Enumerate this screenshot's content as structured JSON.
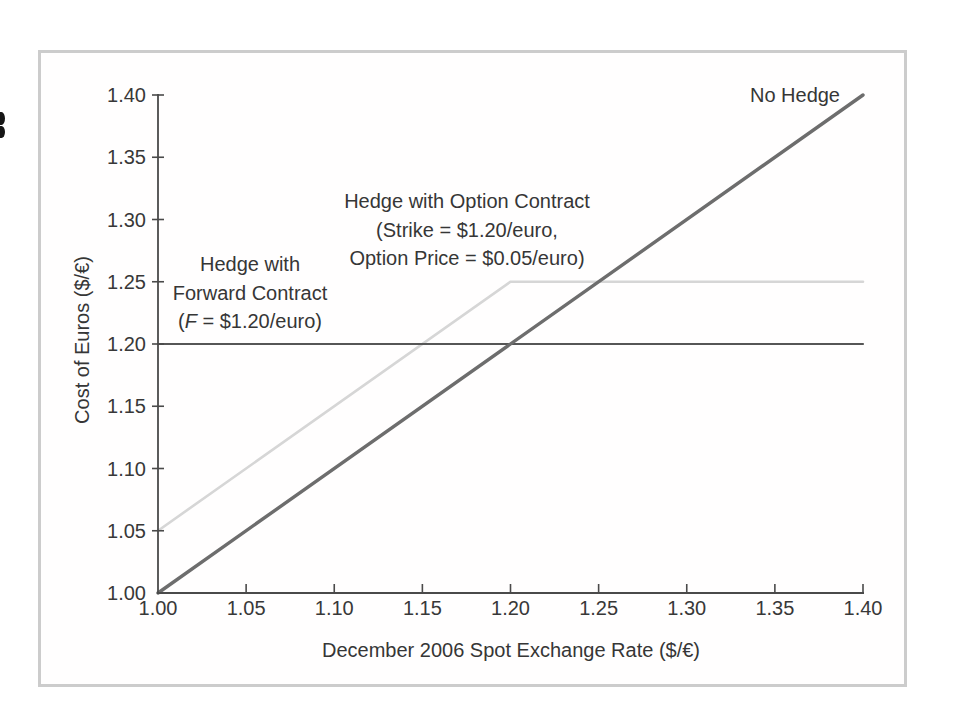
{
  "figure": {
    "border_color": "#cccccc",
    "annotations": {
      "no_hedge": "No Hedge",
      "forward": {
        "line1": "Hedge with",
        "line2": "Forward Contract",
        "line3_open": "(",
        "line3_italic": "F",
        "line3_rest": " = $1.20/euro)"
      },
      "option": {
        "line1": "Hedge with Option Contract",
        "line2": "(Strike = $1.20/euro,",
        "line3": "Option Price = $0.05/euro)"
      }
    }
  },
  "chart_data": {
    "type": "line",
    "title": "",
    "xlabel": "December 2006 Spot Exchange Rate ($/€)",
    "ylabel": "Cost of Euros ($/€)",
    "xlim": [
      1.0,
      1.4
    ],
    "ylim": [
      1.0,
      1.4
    ],
    "xticks": [
      1.0,
      1.05,
      1.1,
      1.15,
      1.2,
      1.25,
      1.3,
      1.35,
      1.4
    ],
    "yticks": [
      1.0,
      1.05,
      1.1,
      1.15,
      1.2,
      1.25,
      1.3,
      1.35,
      1.4
    ],
    "xtick_labels": [
      "1.00",
      "1.05",
      "1.10",
      "1.15",
      "1.20",
      "1.25",
      "1.30",
      "1.35",
      "1.40"
    ],
    "ytick_labels": [
      "1.00",
      "1.05",
      "1.10",
      "1.15",
      "1.20",
      "1.25",
      "1.30",
      "1.35",
      "1.40"
    ],
    "grid": false,
    "legend_position": "inline-annotations",
    "axis_color": "#4a4a4a",
    "tick_label_color": "#383838",
    "series": [
      {
        "id": "option-hedge",
        "name": "Hedge with Option Contract (Strike = $1.20/euro, Option Price = $0.05/euro)",
        "points": [
          [
            1.0,
            1.05
          ],
          [
            1.2,
            1.25
          ],
          [
            1.4,
            1.25
          ]
        ],
        "color": "#d6d6d6",
        "width": 2.6
      },
      {
        "id": "forward-hedge",
        "name": "Hedge with Forward Contract (F = $1.20/euro)",
        "points": [
          [
            1.0,
            1.2
          ],
          [
            1.4,
            1.2
          ]
        ],
        "color": "#565656",
        "width": 2.2
      },
      {
        "id": "no-hedge",
        "name": "No Hedge",
        "points": [
          [
            1.0,
            1.0
          ],
          [
            1.4,
            1.4
          ]
        ],
        "color": "#6d6d6d",
        "width": 3.4
      }
    ]
  }
}
